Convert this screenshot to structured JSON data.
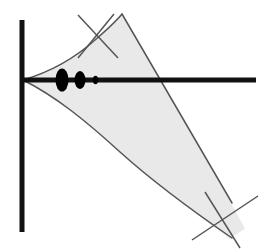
{
  "figure": {
    "width": 278,
    "height": 250,
    "background_color": "#ffffff"
  },
  "colors": {
    "axis_stroke": "#111111",
    "curve_stroke": "#4a4a4a",
    "wedge_fill": "#e9e9e9",
    "wedge_stroke": "#555555",
    "ellipse_fill": "#000000",
    "cross_stroke": "#555555"
  },
  "axes": {
    "vertical": {
      "label": "vertical-axis",
      "x": 22,
      "y_top": 20,
      "y_bottom": 232,
      "stroke_width": 5
    },
    "horizontal": {
      "label": "horizontal-axis",
      "y": 80,
      "x_left": 22,
      "x_right": 256,
      "stroke_width": 5
    },
    "origin": {
      "x": 22,
      "y": 80
    }
  },
  "wedge": {
    "label": "shaded-wedge-region",
    "apex": {
      "x": 23,
      "y": 80
    },
    "upper_boundary_path": "M 23 80 C 50 72 75 58 95 40 C 110 27 118 19 122 14",
    "lower_boundary_path": "M 23 80 C 55 96 85 120 120 152 C 160 188 200 216 232 238",
    "upper_far_edge_path": "M 122 14 C 150 62 190 130 232 203",
    "lower_far_edge_path": "M 232 238 C 222 226 214 216 208 208",
    "fill_path": "M 23 80 C 50 72 75 58 95 40 C 110 27 118 19 122 14 C 150 62 190 130 236 212 C 240 219 243 225 245 229 C 238 233 233 236 230 239 C 198 214 158 186 119 151 C 84 119 55 96 23 80 Z"
  },
  "ellipses": [
    {
      "label": "ellipse-large",
      "cx": 62,
      "cy": 80,
      "rx": 6.5,
      "ry": 11.5
    },
    {
      "label": "ellipse-medium",
      "cx": 80,
      "cy": 80,
      "rx": 5.5,
      "ry": 9.0
    },
    {
      "label": "ellipse-small",
      "cx": 95.5,
      "cy": 80,
      "rx": 2.6,
      "ry": 4.2
    }
  ],
  "crossing_marks": [
    {
      "label": "cross-top",
      "center": {
        "x": 96,
        "y": 37
      },
      "stroke_a": {
        "x1": 78,
        "y1": 15,
        "x2": 118,
        "y2": 58
      },
      "stroke_b": {
        "x1": 114,
        "y1": 14,
        "x2": 78,
        "y2": 58
      }
    },
    {
      "label": "cross-bottom-right",
      "center": {
        "x": 222,
        "y": 222
      },
      "stroke_a": {
        "x1": 192,
        "y1": 240,
        "x2": 258,
        "y2": 196
      },
      "stroke_b": {
        "x1": 205,
        "y1": 192,
        "x2": 240,
        "y2": 248
      }
    }
  ],
  "legend": {
    "visible": false,
    "entries": []
  },
  "annotations": {
    "text_labels": []
  }
}
